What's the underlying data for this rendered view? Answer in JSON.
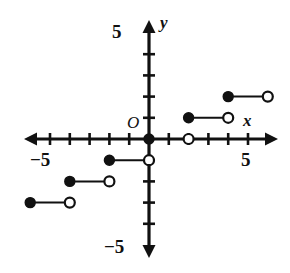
{
  "figure": {
    "kind": "coordinate-plane-step-function",
    "background_color": "#ffffff",
    "ink_color": "#111111",
    "width": 290,
    "height": 273
  },
  "labels": {
    "x_axis": "x",
    "y_axis": "y",
    "origin": "O",
    "x_tick_negative": "−5",
    "x_tick_positive": "5",
    "y_tick_positive": "5",
    "y_tick_negative": "−5"
  },
  "chart_data": {
    "type": "line",
    "title": "",
    "xlabel": "x",
    "ylabel": "y",
    "grid": false,
    "legend": "none",
    "xlim": [
      -7,
      7
    ],
    "ylim": [
      -6,
      6
    ],
    "x_ticks": [
      -6,
      -5,
      -4,
      -3,
      -2,
      -1,
      0,
      1,
      2,
      3,
      4,
      5,
      6
    ],
    "y_ticks": [
      -5,
      -4,
      -3,
      -2,
      -1,
      0,
      1,
      2,
      3,
      4,
      5
    ],
    "labeled_x_ticks": [
      {
        "value": -5,
        "text": "−5"
      },
      {
        "value": 5,
        "text": "5"
      }
    ],
    "labeled_y_ticks": [
      {
        "value": 5,
        "text": "5"
      },
      {
        "value": -5,
        "text": "−5"
      }
    ],
    "series": [
      {
        "name": "step-function",
        "segments": [
          {
            "x_start": -6,
            "x_end": -4,
            "y": -3,
            "start_endpoint": "closed",
            "end_endpoint": "open"
          },
          {
            "x_start": -4,
            "x_end": -2,
            "y": -2,
            "start_endpoint": "closed",
            "end_endpoint": "open"
          },
          {
            "x_start": -2,
            "x_end": 0,
            "y": -1,
            "start_endpoint": "closed",
            "end_endpoint": "open"
          },
          {
            "x_start": 0,
            "x_end": 2,
            "y": 0,
            "start_endpoint": "closed",
            "end_endpoint": "open"
          },
          {
            "x_start": 2,
            "x_end": 4,
            "y": 1,
            "start_endpoint": "closed",
            "end_endpoint": "open"
          },
          {
            "x_start": 4,
            "x_end": 6,
            "y": 2,
            "start_endpoint": "closed",
            "end_endpoint": "open"
          }
        ]
      }
    ]
  },
  "geometry": {
    "origin_px": {
      "x": 149,
      "y": 139
    },
    "unit_px": {
      "x": 19.8,
      "y": 21.2
    },
    "tick_half_len": 6,
    "dot_radius": 5
  }
}
